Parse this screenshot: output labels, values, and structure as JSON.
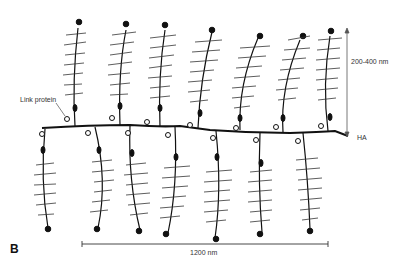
{
  "figure": {
    "panel_label": "B",
    "labels": {
      "link_protein": "Link protein",
      "height_range": "200-400 nm",
      "backbone": "HA",
      "length": "1200 nm"
    },
    "structure": {
      "backbone": "hyaluronan (HA) chain",
      "upper_monomers": 8,
      "lower_monomers": 7
    }
  }
}
